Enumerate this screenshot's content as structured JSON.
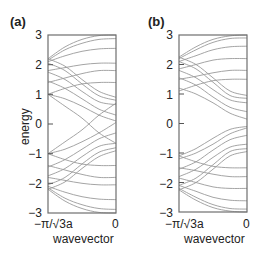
{
  "chart_data": [
    {
      "type": "line",
      "panel": "(a)",
      "title": "(a)",
      "xlabel": "wavevector",
      "ylabel": "energy",
      "xticks": [
        "−π/√3a",
        "0"
      ],
      "yticks": [
        "3",
        "2",
        "1",
        "0",
        "−1",
        "−2",
        "−3"
      ],
      "ylim": [
        -3,
        3
      ],
      "xlim": [
        0,
        1
      ],
      "grid": false,
      "line_color": "#9a9a9a",
      "x": [
        0,
        0.25,
        0.5,
        0.75,
        1.0
      ],
      "series": [
        {
          "name": "band 1",
          "values": [
            2.2,
            2.6,
            2.85,
            2.98,
            3.0
          ]
        },
        {
          "name": "band 2",
          "values": [
            2.15,
            2.5,
            2.72,
            2.85,
            2.88
          ]
        },
        {
          "name": "band 3",
          "values": [
            2.1,
            2.3,
            2.45,
            2.53,
            2.55
          ]
        },
        {
          "name": "band 4",
          "values": [
            1.8,
            1.9,
            2.0,
            2.05,
            2.05
          ]
        },
        {
          "name": "band 5",
          "values": [
            2.2,
            1.95,
            1.5,
            1.1,
            0.9
          ]
        },
        {
          "name": "band 6",
          "values": [
            2.05,
            1.8,
            1.35,
            0.95,
            0.8
          ]
        },
        {
          "name": "band 7",
          "values": [
            1.4,
            1.55,
            1.7,
            1.8,
            1.8
          ]
        },
        {
          "name": "band 8",
          "values": [
            1.0,
            1.2,
            1.35,
            1.4,
            1.4
          ]
        },
        {
          "name": "band 9",
          "values": [
            1.75,
            1.5,
            1.1,
            0.75,
            0.65
          ]
        },
        {
          "name": "band 10",
          "values": [
            1.45,
            1.2,
            0.85,
            0.5,
            0.3
          ]
        },
        {
          "name": "band 11",
          "values": [
            1.0,
            0.85,
            0.6,
            0.3,
            0.1
          ]
        },
        {
          "name": "band 12",
          "values": [
            1.0,
            0.6,
            0.2,
            -0.3,
            -0.65
          ]
        },
        {
          "name": "band 13",
          "values": [
            -1.0,
            -0.6,
            -0.2,
            0.3,
            0.7
          ]
        },
        {
          "name": "band 14",
          "values": [
            -1.0,
            -0.85,
            -0.6,
            -0.3,
            0.05
          ]
        },
        {
          "name": "band 15",
          "values": [
            -1.45,
            -1.2,
            -0.85,
            -0.5,
            -0.3
          ]
        },
        {
          "name": "band 16",
          "values": [
            -1.75,
            -1.5,
            -1.1,
            -0.75,
            -0.65
          ]
        },
        {
          "name": "band 17",
          "values": [
            -1.0,
            -1.2,
            -1.35,
            -1.4,
            -1.4
          ]
        },
        {
          "name": "band 18",
          "values": [
            -1.4,
            -1.55,
            -1.7,
            -1.8,
            -1.8
          ]
        },
        {
          "name": "band 19",
          "values": [
            -2.05,
            -1.8,
            -1.35,
            -0.95,
            -0.8
          ]
        },
        {
          "name": "band 20",
          "values": [
            -2.2,
            -1.95,
            -1.5,
            -1.1,
            -0.9
          ]
        },
        {
          "name": "band 21",
          "values": [
            -1.8,
            -1.9,
            -2.0,
            -2.05,
            -2.05
          ]
        },
        {
          "name": "band 22",
          "values": [
            -2.1,
            -2.3,
            -2.45,
            -2.53,
            -2.55
          ]
        },
        {
          "name": "band 23",
          "values": [
            -2.15,
            -2.5,
            -2.72,
            -2.85,
            -2.88
          ]
        },
        {
          "name": "band 24",
          "values": [
            -2.2,
            -2.6,
            -2.85,
            -2.98,
            -3.0
          ]
        }
      ]
    },
    {
      "type": "line",
      "panel": "(b)",
      "title": "(b)",
      "xlabel": "wavevector",
      "ylabel": "",
      "xticks": [
        "−π/√3a",
        "0"
      ],
      "yticks": [
        "3",
        "2",
        "1",
        "0",
        "−1",
        "−2",
        "−3"
      ],
      "ylim": [
        -3,
        3
      ],
      "xlim": [
        0,
        1
      ],
      "grid": false,
      "line_color": "#9a9a9a",
      "x": [
        0,
        0.25,
        0.5,
        0.75,
        1.0
      ],
      "series": [
        {
          "name": "band 1",
          "values": [
            2.25,
            2.6,
            2.85,
            2.97,
            3.0
          ]
        },
        {
          "name": "band 2",
          "values": [
            2.2,
            2.5,
            2.75,
            2.88,
            2.9
          ]
        },
        {
          "name": "band 3",
          "values": [
            2.1,
            2.3,
            2.5,
            2.6,
            2.62
          ]
        },
        {
          "name": "band 4",
          "values": [
            1.85,
            2.0,
            2.15,
            2.2,
            2.2
          ]
        },
        {
          "name": "band 5",
          "values": [
            2.25,
            2.0,
            1.55,
            1.1,
            0.95
          ]
        },
        {
          "name": "band 6",
          "values": [
            2.1,
            1.85,
            1.4,
            0.95,
            0.85
          ]
        },
        {
          "name": "band 7",
          "values": [
            1.5,
            1.6,
            1.72,
            1.8,
            1.8
          ]
        },
        {
          "name": "band 8",
          "values": [
            1.1,
            1.3,
            1.45,
            1.5,
            1.5
          ]
        },
        {
          "name": "band 9",
          "values": [
            1.8,
            1.55,
            1.15,
            0.8,
            0.7
          ]
        },
        {
          "name": "band 10",
          "values": [
            1.55,
            1.3,
            0.9,
            0.55,
            0.4
          ]
        },
        {
          "name": "band 11",
          "values": [
            1.2,
            1.0,
            0.7,
            0.35,
            0.15
          ]
        },
        {
          "name": "band 12",
          "values": [
            -1.2,
            -1.0,
            -0.7,
            -0.35,
            -0.15
          ]
        },
        {
          "name": "band 13",
          "values": [
            -1.1,
            -0.85,
            -0.5,
            -0.2,
            -0.1
          ]
        },
        {
          "name": "band 14",
          "values": [
            -1.55,
            -1.3,
            -0.9,
            -0.55,
            -0.4
          ]
        },
        {
          "name": "band 15",
          "values": [
            -1.8,
            -1.55,
            -1.15,
            -0.8,
            -0.7
          ]
        },
        {
          "name": "band 16",
          "values": [
            -1.1,
            -1.3,
            -1.45,
            -1.5,
            -1.5
          ]
        },
        {
          "name": "band 17",
          "values": [
            -1.5,
            -1.6,
            -1.72,
            -1.8,
            -1.8
          ]
        },
        {
          "name": "band 18",
          "values": [
            -2.1,
            -1.85,
            -1.4,
            -0.95,
            -0.85
          ]
        },
        {
          "name": "band 19",
          "values": [
            -2.25,
            -2.0,
            -1.55,
            -1.1,
            -0.95
          ]
        },
        {
          "name": "band 20",
          "values": [
            -1.85,
            -2.0,
            -2.15,
            -2.2,
            -2.2
          ]
        },
        {
          "name": "band 21",
          "values": [
            -2.1,
            -2.3,
            -2.5,
            -2.6,
            -2.62
          ]
        },
        {
          "name": "band 22",
          "values": [
            -2.2,
            -2.5,
            -2.75,
            -2.88,
            -2.9
          ]
        },
        {
          "name": "band 23",
          "values": [
            -2.25,
            -2.6,
            -2.85,
            -2.97,
            -3.0
          ]
        }
      ]
    }
  ],
  "panels": [
    {
      "label": "(a)",
      "ylabel": "energy",
      "xlabel": "wavevector",
      "xtick_left": "−π/√3a",
      "xtick_right": "0"
    },
    {
      "label": "(b)",
      "ylabel": "",
      "xlabel": "wavevector",
      "xtick_left": "−π/√3a",
      "xtick_right": "0"
    }
  ],
  "yticks": [
    "3",
    "2",
    "1",
    "0",
    "−1",
    "−2",
    "−3"
  ]
}
